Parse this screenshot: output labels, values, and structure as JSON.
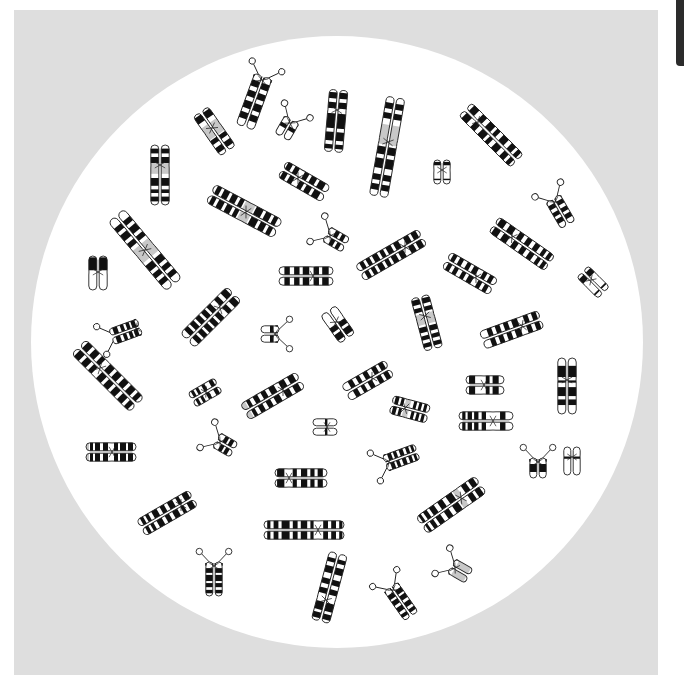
{
  "figure": {
    "background_color": "#dedede",
    "field_color": "#ffffff",
    "field": {
      "cx": 337,
      "cy": 342,
      "r": 306
    },
    "band_color": "#111111",
    "shade_color": "#c8c8c8",
    "outline_color": "#222222"
  },
  "chromosomes": [
    {
      "cx": 262,
      "cy": 80,
      "a": 20,
      "p": 4,
      "q": 50,
      "w": 8,
      "sat": "p",
      "bands": [
        [
          0.12,
          0.24
        ],
        [
          0.32,
          0.44
        ],
        [
          0.52,
          0.66
        ],
        [
          0.74,
          0.86
        ]
      ]
    },
    {
      "cx": 212,
      "cy": 128,
      "a": -35,
      "p": 20,
      "q": 28,
      "w": 8,
      "shade": [
        [
          0.3,
          0.6
        ]
      ],
      "bands": [
        [
          0.05,
          0.2
        ],
        [
          0.62,
          0.72
        ],
        [
          0.8,
          0.92
        ]
      ]
    },
    {
      "cx": 290,
      "cy": 123,
      "a": 30,
      "p": 4,
      "q": 16,
      "w": 7,
      "sat": "p",
      "bands": [
        [
          0.35,
          0.55
        ]
      ]
    },
    {
      "cx": 337,
      "cy": 110,
      "a": 5,
      "p": 20,
      "q": 42,
      "w": 8,
      "bands": [
        [
          0.04,
          0.14
        ],
        [
          0.2,
          0.3
        ],
        [
          0.38,
          0.62
        ],
        [
          0.68,
          0.82
        ],
        [
          0.88,
          0.95
        ]
      ]
    },
    {
      "cx": 388,
      "cy": 142,
      "a": 10,
      "p": 45,
      "q": 55,
      "w": 8,
      "shade": [
        [
          0.28,
          0.48
        ]
      ],
      "bands": [
        [
          0.06,
          0.12
        ],
        [
          0.16,
          0.22
        ],
        [
          0.5,
          0.58
        ],
        [
          0.62,
          0.72
        ],
        [
          0.78,
          0.84
        ],
        [
          0.88,
          0.94
        ]
      ]
    },
    {
      "cx": 478,
      "cy": 122,
      "a": -45,
      "p": 18,
      "q": 55,
      "w": 8,
      "bands": [
        [
          0.05,
          0.15
        ],
        [
          0.22,
          0.3
        ],
        [
          0.36,
          0.46
        ],
        [
          0.5,
          0.56
        ],
        [
          0.62,
          0.72
        ],
        [
          0.78,
          0.86
        ],
        [
          0.9,
          0.96
        ]
      ]
    },
    {
      "cx": 160,
      "cy": 165,
      "a": 0,
      "p": 20,
      "q": 40,
      "w": 8,
      "shade": [
        [
          0.3,
          0.48
        ]
      ],
      "bands": [
        [
          0.06,
          0.14
        ],
        [
          0.2,
          0.3
        ],
        [
          0.55,
          0.68
        ],
        [
          0.74,
          0.8
        ],
        [
          0.86,
          0.94
        ]
      ]
    },
    {
      "cx": 298,
      "cy": 178,
      "a": -60,
      "p": 18,
      "q": 32,
      "w": 8,
      "bands": [
        [
          0.04,
          0.14
        ],
        [
          0.2,
          0.3
        ],
        [
          0.42,
          0.52
        ],
        [
          0.58,
          0.7
        ],
        [
          0.76,
          0.9
        ]
      ]
    },
    {
      "cx": 442,
      "cy": 170,
      "a": 0,
      "p": 10,
      "q": 14,
      "w": 7,
      "bands": [
        [
          0.08,
          0.22
        ],
        [
          0.78,
          0.84
        ]
      ]
    },
    {
      "cx": 246,
      "cy": 212,
      "a": -62,
      "p": 40,
      "q": 36,
      "w": 9,
      "shade": [
        [
          0.46,
          0.6
        ]
      ],
      "bands": [
        [
          0.04,
          0.1
        ],
        [
          0.14,
          0.22
        ],
        [
          0.26,
          0.34
        ],
        [
          0.38,
          0.44
        ],
        [
          0.62,
          0.72
        ],
        [
          0.76,
          0.84
        ],
        [
          0.88,
          0.94
        ]
      ]
    },
    {
      "cx": 555,
      "cy": 202,
      "a": -30,
      "p": 4,
      "q": 26,
      "w": 7,
      "sat": "p",
      "bands": [
        [
          0.15,
          0.3
        ],
        [
          0.42,
          0.56
        ],
        [
          0.66,
          0.82
        ]
      ]
    },
    {
      "cx": 145,
      "cy": 250,
      "a": -40,
      "p": 45,
      "q": 45,
      "w": 9,
      "shade": [
        [
          0.42,
          0.6
        ]
      ],
      "bands": [
        [
          0.1,
          0.16
        ],
        [
          0.2,
          0.28
        ],
        [
          0.32,
          0.38
        ],
        [
          0.64,
          0.72
        ],
        [
          0.76,
          0.82
        ],
        [
          0.86,
          0.92
        ]
      ]
    },
    {
      "cx": 98,
      "cy": 272,
      "a": 0,
      "p": 16,
      "q": 18,
      "w": 8,
      "bands": [
        [
          0.04,
          0.42
        ]
      ]
    },
    {
      "cx": 330,
      "cy": 236,
      "a": -60,
      "p": 4,
      "q": 18,
      "w": 7,
      "sat": "p",
      "bands": [
        [
          0.3,
          0.5
        ],
        [
          0.62,
          0.8
        ]
      ]
    },
    {
      "cx": 405,
      "cy": 247,
      "a": 60,
      "p": 20,
      "q": 52,
      "w": 8,
      "bands": [
        [
          0.04,
          0.12
        ],
        [
          0.16,
          0.24
        ],
        [
          0.32,
          0.4
        ],
        [
          0.44,
          0.52
        ],
        [
          0.56,
          0.62
        ],
        [
          0.66,
          0.74
        ],
        [
          0.78,
          0.84
        ],
        [
          0.88,
          0.94
        ]
      ]
    },
    {
      "cx": 512,
      "cy": 237,
      "a": -55,
      "p": 22,
      "q": 46,
      "w": 8,
      "bands": [
        [
          0.04,
          0.14
        ],
        [
          0.2,
          0.3
        ],
        [
          0.38,
          0.46
        ],
        [
          0.52,
          0.6
        ],
        [
          0.66,
          0.74
        ],
        [
          0.8,
          0.86
        ],
        [
          0.9,
          0.96
        ]
      ]
    },
    {
      "cx": 313,
      "cy": 276,
      "a": 90,
      "p": 20,
      "q": 34,
      "w": 8,
      "bands": [
        [
          0.08,
          0.2
        ],
        [
          0.26,
          0.36
        ],
        [
          0.44,
          0.56
        ],
        [
          0.62,
          0.72
        ],
        [
          0.8,
          0.9
        ]
      ]
    },
    {
      "cx": 476,
      "cy": 277,
      "a": -60,
      "p": 34,
      "q": 20,
      "w": 8,
      "bands": [
        [
          0.06,
          0.14
        ],
        [
          0.2,
          0.28
        ],
        [
          0.36,
          0.44
        ],
        [
          0.5,
          0.6
        ],
        [
          0.7,
          0.78
        ],
        [
          0.84,
          0.92
        ]
      ]
    },
    {
      "cx": 591,
      "cy": 280,
      "a": -45,
      "p": 12,
      "q": 18,
      "w": 7,
      "bands": [
        [
          0.1,
          0.3
        ],
        [
          0.8,
          0.86
        ]
      ]
    },
    {
      "cx": 220,
      "cy": 308,
      "a": 45,
      "p": 20,
      "q": 46,
      "w": 9,
      "bands": [
        [
          0.04,
          0.14
        ],
        [
          0.2,
          0.28
        ],
        [
          0.36,
          0.44
        ],
        [
          0.48,
          0.56
        ],
        [
          0.6,
          0.68
        ],
        [
          0.72,
          0.8
        ],
        [
          0.84,
          0.92
        ]
      ]
    },
    {
      "cx": 136,
      "cy": 328,
      "a": 70,
      "p": 4,
      "q": 26,
      "w": 7,
      "sat": "q",
      "bands": [
        [
          0.1,
          0.24
        ],
        [
          0.3,
          0.42
        ],
        [
          0.5,
          0.62
        ],
        [
          0.72,
          0.88
        ]
      ]
    },
    {
      "cx": 275,
      "cy": 334,
      "a": 90,
      "p": 4,
      "q": 14,
      "w": 7,
      "sat": "p",
      "bands": [
        [
          0.3,
          0.5
        ]
      ]
    },
    {
      "cx": 336,
      "cy": 322,
      "a": -35,
      "p": 14,
      "q": 20,
      "w": 8,
      "bands": [
        [
          0.46,
          0.62
        ],
        [
          0.7,
          0.9
        ]
      ]
    },
    {
      "cx": 425,
      "cy": 316,
      "a": -15,
      "p": 20,
      "q": 34,
      "w": 8,
      "shade": [
        [
          0.32,
          0.52
        ]
      ],
      "bands": [
        [
          0.04,
          0.14
        ],
        [
          0.2,
          0.28
        ],
        [
          0.56,
          0.66
        ],
        [
          0.72,
          0.8
        ],
        [
          0.86,
          0.94
        ]
      ]
    },
    {
      "cx": 522,
      "cy": 326,
      "a": 70,
      "p": 20,
      "q": 42,
      "w": 8,
      "bands": [
        [
          0.04,
          0.12
        ],
        [
          0.18,
          0.26
        ],
        [
          0.36,
          0.46
        ],
        [
          0.52,
          0.6
        ],
        [
          0.66,
          0.74
        ],
        [
          0.8,
          0.88
        ]
      ]
    },
    {
      "cx": 100,
      "cy": 368,
      "a": -45,
      "p": 30,
      "q": 52,
      "w": 9,
      "bands": [
        [
          0.04,
          0.12
        ],
        [
          0.16,
          0.24
        ],
        [
          0.28,
          0.34
        ],
        [
          0.42,
          0.5
        ],
        [
          0.54,
          0.62
        ],
        [
          0.66,
          0.74
        ],
        [
          0.78,
          0.86
        ],
        [
          0.9,
          0.96
        ]
      ]
    },
    {
      "cx": 567,
      "cy": 380,
      "a": 0,
      "p": 22,
      "q": 34,
      "w": 8,
      "bands": [
        [
          0.14,
          0.34
        ],
        [
          0.4,
          0.44
        ],
        [
          0.52,
          0.68
        ],
        [
          0.74,
          0.84
        ]
      ]
    },
    {
      "cx": 206,
      "cy": 392,
      "a": 60,
      "p": 14,
      "q": 16,
      "w": 7,
      "bands": [
        [
          0.08,
          0.22
        ],
        [
          0.38,
          0.5
        ],
        [
          0.62,
          0.72
        ],
        [
          0.8,
          0.9
        ]
      ]
    },
    {
      "cx": 283,
      "cy": 390,
      "a": 60,
      "p": 20,
      "q": 44,
      "w": 8,
      "shade": [
        [
          0.92,
          1.0
        ]
      ],
      "bands": [
        [
          0.06,
          0.16
        ],
        [
          0.22,
          0.32
        ],
        [
          0.4,
          0.5
        ],
        [
          0.56,
          0.64
        ],
        [
          0.7,
          0.78
        ],
        [
          0.84,
          0.9
        ]
      ]
    },
    {
      "cx": 372,
      "cy": 378,
      "a": 60,
      "p": 20,
      "q": 30,
      "w": 8,
      "bands": [
        [
          0.06,
          0.16
        ],
        [
          0.22,
          0.32
        ],
        [
          0.42,
          0.52
        ],
        [
          0.6,
          0.68
        ],
        [
          0.76,
          0.86
        ]
      ]
    },
    {
      "cx": 484,
      "cy": 385,
      "a": -90,
      "p": 18,
      "q": 20,
      "w": 8,
      "bands": [
        [
          0.08,
          0.24
        ],
        [
          0.52,
          0.62
        ],
        [
          0.7,
          0.86
        ]
      ]
    },
    {
      "cx": 405,
      "cy": 408,
      "a": -75,
      "p": 14,
      "q": 24,
      "w": 8,
      "shade": [
        [
          0.34,
          0.48
        ]
      ],
      "bands": [
        [
          0.06,
          0.16
        ],
        [
          0.22,
          0.3
        ],
        [
          0.56,
          0.64
        ],
        [
          0.7,
          0.78
        ],
        [
          0.84,
          0.92
        ]
      ]
    },
    {
      "cx": 327,
      "cy": 427,
      "a": 90,
      "p": 10,
      "q": 14,
      "w": 7,
      "bands": [
        [
          0.4,
          0.5
        ]
      ]
    },
    {
      "cx": 493,
      "cy": 421,
      "a": 90,
      "p": 20,
      "q": 34,
      "w": 8,
      "bands": [
        [
          0.14,
          0.24
        ],
        [
          0.5,
          0.58
        ],
        [
          0.64,
          0.72
        ],
        [
          0.76,
          0.84
        ],
        [
          0.88,
          0.94
        ]
      ]
    },
    {
      "cx": 112,
      "cy": 452,
      "a": 90,
      "p": 24,
      "q": 26,
      "w": 8,
      "shade": [
        [
          0.94,
          1.0
        ]
      ],
      "bands": [
        [
          0.06,
          0.16
        ],
        [
          0.2,
          0.32
        ],
        [
          0.36,
          0.44
        ],
        [
          0.56,
          0.66
        ],
        [
          0.72,
          0.82
        ],
        [
          0.86,
          0.92
        ]
      ]
    },
    {
      "cx": 220,
      "cy": 442,
      "a": -60,
      "p": 4,
      "q": 16,
      "w": 7,
      "sat": "p",
      "bands": [
        [
          0.3,
          0.5
        ],
        [
          0.6,
          0.8
        ]
      ]
    },
    {
      "cx": 538,
      "cy": 462,
      "a": 0,
      "p": 4,
      "q": 16,
      "w": 7,
      "sat": "p",
      "bands": [
        [
          0.3,
          0.7
        ]
      ]
    },
    {
      "cx": 572,
      "cy": 457,
      "a": 0,
      "p": 10,
      "q": 18,
      "w": 7,
      "bands": [
        [
          0.34,
          0.42
        ]
      ]
    },
    {
      "cx": 389,
      "cy": 462,
      "a": -110,
      "p": 4,
      "q": 30,
      "w": 7,
      "sat": "p",
      "bands": [
        [
          0.14,
          0.26
        ],
        [
          0.32,
          0.42
        ],
        [
          0.5,
          0.62
        ],
        [
          0.7,
          0.8
        ],
        [
          0.86,
          0.94
        ]
      ]
    },
    {
      "cx": 289,
      "cy": 478,
      "a": -90,
      "p": 14,
      "q": 38,
      "w": 8,
      "bands": [
        [
          0.04,
          0.18
        ],
        [
          0.34,
          0.42
        ],
        [
          0.5,
          0.62
        ],
        [
          0.68,
          0.76
        ],
        [
          0.82,
          0.92
        ]
      ]
    },
    {
      "cx": 181,
      "cy": 505,
      "a": 60,
      "p": 14,
      "q": 46,
      "w": 8,
      "bands": [
        [
          0.04,
          0.14
        ],
        [
          0.2,
          0.26
        ],
        [
          0.32,
          0.42
        ],
        [
          0.48,
          0.56
        ],
        [
          0.62,
          0.72
        ],
        [
          0.78,
          0.84
        ],
        [
          0.88,
          0.94
        ]
      ]
    },
    {
      "cx": 461,
      "cy": 498,
      "a": 55,
      "p": 24,
      "q": 48,
      "w": 9,
      "shade": [
        [
          0.3,
          0.38
        ]
      ],
      "bands": [
        [
          0.04,
          0.12
        ],
        [
          0.16,
          0.24
        ],
        [
          0.4,
          0.5
        ],
        [
          0.56,
          0.64
        ],
        [
          0.7,
          0.78
        ],
        [
          0.82,
          0.88
        ],
        [
          0.92,
          0.96
        ]
      ]
    },
    {
      "cx": 318,
      "cy": 530,
      "a": -90,
      "p": 54,
      "q": 26,
      "w": 8,
      "bands": [
        [
          0.04,
          0.08
        ],
        [
          0.12,
          0.18
        ],
        [
          0.22,
          0.32
        ],
        [
          0.36,
          0.42
        ],
        [
          0.46,
          0.54
        ],
        [
          0.58,
          0.62
        ],
        [
          0.74,
          0.8
        ],
        [
          0.84,
          0.9
        ],
        [
          0.94,
          0.98
        ]
      ]
    },
    {
      "cx": 214,
      "cy": 566,
      "a": 0,
      "p": 4,
      "q": 30,
      "w": 7,
      "sat": "p",
      "bands": [
        [
          0.18,
          0.32
        ],
        [
          0.38,
          0.56
        ],
        [
          0.62,
          0.74
        ],
        [
          0.82,
          0.92
        ]
      ]
    },
    {
      "cx": 326,
      "cy": 600,
      "a": 15,
      "p": 48,
      "q": 22,
      "w": 8,
      "bands": [
        [
          0.08,
          0.14
        ],
        [
          0.2,
          0.3
        ],
        [
          0.38,
          0.46
        ],
        [
          0.52,
          0.6
        ],
        [
          0.72,
          0.84
        ],
        [
          0.88,
          0.96
        ]
      ]
    },
    {
      "cx": 393,
      "cy": 590,
      "a": -35,
      "p": 4,
      "q": 32,
      "w": 7,
      "sat": "p",
      "bands": [
        [
          0.16,
          0.3
        ],
        [
          0.36,
          0.5
        ],
        [
          0.58,
          0.72
        ],
        [
          0.8,
          0.9
        ]
      ]
    },
    {
      "cx": 455,
      "cy": 568,
      "a": -60,
      "p": 4,
      "q": 16,
      "w": 7,
      "sat": "p",
      "shade": [
        [
          0.2,
          0.9
        ]
      ],
      "bands": []
    }
  ]
}
